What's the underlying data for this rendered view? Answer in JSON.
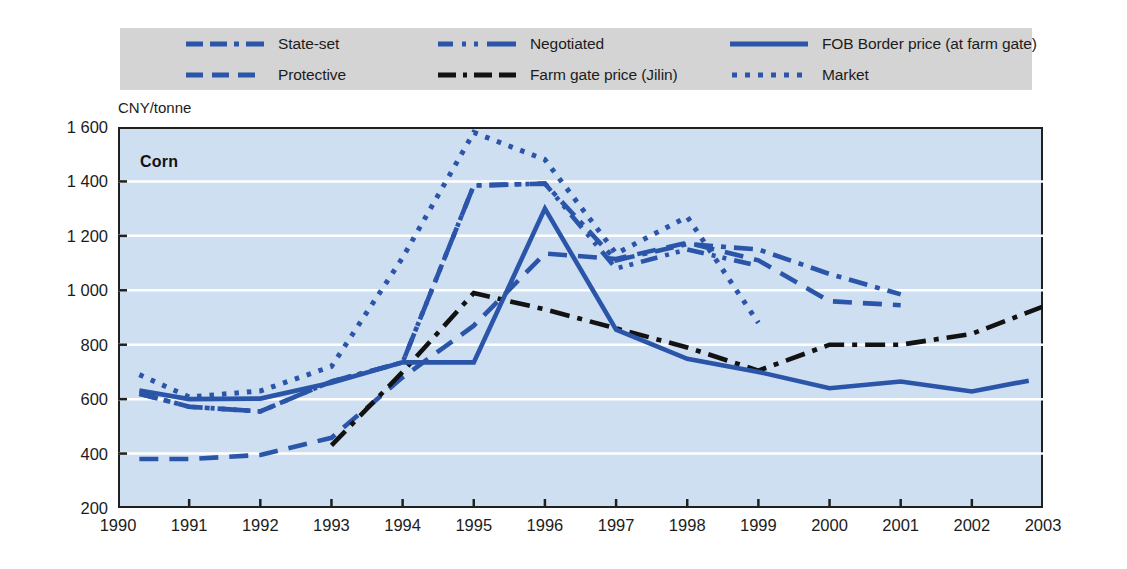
{
  "chart_data": {
    "type": "line",
    "title": "Corn",
    "ylabel": "CNY/tonne",
    "xlabel": "",
    "ylim": [
      200,
      1600
    ],
    "xlim": [
      1990,
      2003
    ],
    "ytick_labels": [
      "1 600",
      "1 400",
      "1 200",
      "1 000",
      "800",
      "600",
      "400",
      "200"
    ],
    "ytick_values": [
      1600,
      1400,
      1200,
      1000,
      800,
      600,
      400,
      200
    ],
    "xtick_labels": [
      "1990",
      "1991",
      "1992",
      "1993",
      "1994",
      "1995",
      "1996",
      "1997",
      "1998",
      "1999",
      "2000",
      "2001",
      "2002",
      "2003"
    ],
    "xtick_values": [
      1990,
      1991,
      1992,
      1993,
      1994,
      1995,
      1996,
      1997,
      1998,
      1999,
      2000,
      2001,
      2002,
      2003
    ],
    "grid": "horizontal",
    "legend_position": "top",
    "plot_background": "#cfdff2",
    "legend_background": "#d4d4d4",
    "series": [
      {
        "name": "State-set",
        "style": "dash-dot",
        "color": "#2b55a8",
        "x": [
          1990.3,
          1991,
          1992,
          1993,
          1994,
          1995,
          1996,
          1997,
          1998,
          1999,
          2000,
          2001
        ],
        "values": [
          620,
          572,
          555,
          665,
          735,
          1385,
          1392,
          1110,
          1170,
          1150,
          1060,
          985
        ]
      },
      {
        "name": "Protective",
        "style": "long-dash",
        "color": "#2b55a8",
        "x": [
          1990.3,
          1991,
          1992,
          1993,
          1994,
          1995,
          1996,
          1997,
          1998,
          1999,
          2000,
          2001
        ],
        "values": [
          380,
          380,
          395,
          458,
          680,
          870,
          1135,
          1115,
          1175,
          1110,
          960,
          945
        ]
      },
      {
        "name": "Negotiated",
        "style": "dash-dot-dot",
        "color": "#2b55a8",
        "x": [
          1990.3,
          1991,
          1992,
          1993,
          1994,
          1995,
          1996,
          1997,
          1998,
          1999
        ],
        "values": [
          620,
          572,
          555,
          665,
          735,
          1385,
          1392,
          1080,
          1150,
          1090
        ]
      },
      {
        "name": "Farm gate price (Jilin)",
        "style": "black-dash-dot",
        "color": "#121212",
        "x": [
          1993,
          1994,
          1995,
          1996,
          1997,
          1998,
          1999,
          2000,
          2001,
          2002,
          2003
        ],
        "values": [
          430,
          700,
          990,
          930,
          860,
          790,
          705,
          800,
          800,
          840,
          940
        ]
      },
      {
        "name": "FOB Border price (at farm gate)",
        "style": "solid",
        "color": "#2b55a8",
        "x": [
          1990.3,
          1991,
          1992,
          1993,
          1994,
          1995,
          1996,
          1997,
          1998,
          1999,
          2000,
          2001,
          2002,
          2002.8
        ],
        "values": [
          632,
          600,
          602,
          660,
          735,
          735,
          1300,
          855,
          748,
          700,
          640,
          665,
          628,
          668
        ]
      },
      {
        "name": "Market",
        "style": "dotted",
        "color": "#2b55a8",
        "x": [
          1990.3,
          1991,
          1992,
          1993,
          1994,
          1995,
          1996,
          1997,
          1998,
          1999
        ],
        "values": [
          690,
          608,
          630,
          720,
          1120,
          1580,
          1480,
          1135,
          1270,
          880
        ]
      }
    ]
  },
  "legend": {
    "items": [
      {
        "label": "State-set",
        "swatch": "dash-dot-blue"
      },
      {
        "label": "Negotiated",
        "swatch": "dash-dot-dot-blue"
      },
      {
        "label": "FOB Border price (at farm gate)",
        "swatch": "solid-blue"
      },
      {
        "label": "Protective",
        "swatch": "long-dash-blue"
      },
      {
        "label": "Farm gate price (Jilin)",
        "swatch": "dash-dot-black"
      },
      {
        "label": "Market",
        "swatch": "dotted-blue"
      }
    ]
  }
}
